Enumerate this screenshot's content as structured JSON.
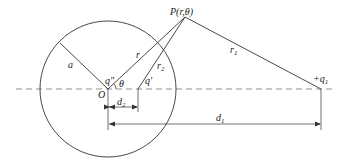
{
  "diagram": {
    "labels": {
      "point_p": "P(r,θ)",
      "radius": "a",
      "origin": "O",
      "image_charge_origin": "q\"",
      "angle": "θ",
      "r": "r",
      "r1": "r",
      "r1_sub": "1",
      "r2": "r",
      "r2_sub": "2",
      "image_charge": "q'",
      "charge": "+q",
      "charge_sub": "1",
      "d2": "d",
      "d2_sub": "2",
      "d1": "d",
      "d1_sub": "1"
    },
    "colors": {
      "line": "#333333",
      "dashed": "#777777"
    }
  }
}
